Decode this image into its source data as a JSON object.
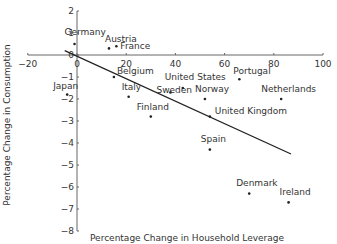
{
  "chart_data": {
    "type": "scatter",
    "title": "",
    "xlabel": "Percentage Change in Household Leverage",
    "ylabel": "Percentage Change in Consumption",
    "xlim": [
      -20,
      100
    ],
    "ylim": [
      -8,
      2
    ],
    "xticks": [
      -20,
      0,
      20,
      40,
      60,
      80,
      100
    ],
    "yticks": [
      2,
      1,
      0,
      -1,
      -2,
      -3,
      -4,
      -5,
      -6,
      -7,
      -8
    ],
    "grid": false,
    "legend": null,
    "points": [
      {
        "label": "Germany",
        "x": -1,
        "y": 0.5
      },
      {
        "label": "Austria",
        "x": 13,
        "y": 0.3
      },
      {
        "label": "France",
        "x": 16,
        "y": 0.4
      },
      {
        "label": "Japan",
        "x": -4,
        "y": -1.8
      },
      {
        "label": "Belgium",
        "x": 15,
        "y": -1.0
      },
      {
        "label": "Italy",
        "x": 21,
        "y": -1.9
      },
      {
        "label": "Finland",
        "x": 30,
        "y": -2.8
      },
      {
        "label": "Sweden",
        "x": 38,
        "y": -1.7
      },
      {
        "label": "United States",
        "x": 43,
        "y": -1.5
      },
      {
        "label": "Norway",
        "x": 52,
        "y": -2.0
      },
      {
        "label": "United Kingdom",
        "x": 54,
        "y": -2.8
      },
      {
        "label": "Portugal",
        "x": 66,
        "y": -1.1
      },
      {
        "label": "Netherlands",
        "x": 83,
        "y": -2.0
      },
      {
        "label": "Spain",
        "x": 54,
        "y": -4.3
      },
      {
        "label": "Denmark",
        "x": 70,
        "y": -6.3
      },
      {
        "label": "Ireland",
        "x": 86,
        "y": -6.7
      }
    ],
    "regression_line": {
      "x1": -5,
      "y1": 0.2,
      "x2": 87,
      "y2": -4.5
    }
  },
  "label_offsets": {
    "Germany": [
      -10,
      -9,
      "start"
    ],
    "Austria": [
      -4,
      -6,
      "start"
    ],
    "France": [
      4,
      3,
      "start"
    ],
    "Japan": [
      -14,
      -6,
      "start"
    ],
    "Belgium": [
      3,
      -3,
      "start"
    ],
    "Italy": [
      -7,
      -7,
      "start"
    ],
    "Finland": [
      -14,
      -7,
      "start"
    ],
    "Sweden": [
      -14,
      1,
      "start"
    ],
    "United States": [
      -18,
      -8,
      "start"
    ],
    "Norway": [
      -10,
      -7,
      "start"
    ],
    "United Kingdom": [
      5,
      -3,
      "start"
    ],
    "Portugal": [
      -6,
      -5,
      "start"
    ],
    "Netherlands": [
      -20,
      -7,
      "start"
    ],
    "Spain": [
      -9,
      -8,
      "start"
    ],
    "Denmark": [
      -13,
      -8,
      "start"
    ],
    "Ireland": [
      -9,
      -7,
      "start"
    ]
  }
}
